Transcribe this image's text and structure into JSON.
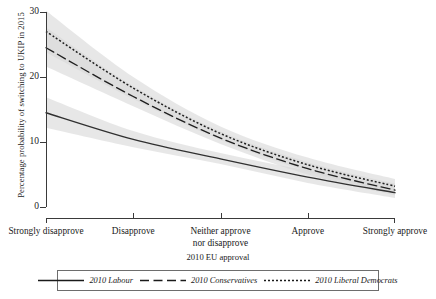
{
  "chart_data": {
    "type": "line",
    "title": "",
    "xlabel": "2010 EU approval",
    "ylabel": "Percentage probability of switching to UKIP in 2015",
    "categories": [
      "Strongly disapprove",
      "Disapprove",
      "Neither approve nor disapprove",
      "Approve",
      "Strongly approve"
    ],
    "category_lines": [
      [
        "Strongly disapprove"
      ],
      [
        "Disapprove"
      ],
      [
        "Neither approve",
        "nor disapprove"
      ],
      [
        "Approve"
      ],
      [
        "Strongly approve"
      ]
    ],
    "x": [
      1,
      2,
      3,
      4,
      5
    ],
    "ylim": [
      0,
      30
    ],
    "yticks": [
      0,
      10,
      20,
      30
    ],
    "ytick_labels": [
      "0",
      "10",
      "20",
      "30"
    ],
    "grid": false,
    "legend_position": "bottom",
    "series": [
      {
        "name": "2010 Labour",
        "style": "solid",
        "color": "#303030",
        "values": [
          14.5,
          10.4,
          7.4,
          4.6,
          2.2
        ],
        "ci_low": [
          12.2,
          9.2,
          6.6,
          3.7,
          1.4
        ],
        "ci_high": [
          16.9,
          11.7,
          8.3,
          5.6,
          3.2
        ]
      },
      {
        "name": "2010 Conservatives",
        "style": "dashed",
        "color": "#202020",
        "values": [
          24.5,
          17.0,
          10.6,
          5.9,
          2.6
        ],
        "ci_low": [
          21.6,
          15.5,
          9.7,
          5.0,
          1.8
        ],
        "ci_high": [
          27.6,
          18.6,
          11.6,
          6.9,
          3.6
        ]
      },
      {
        "name": "2010 Liberal Democrats",
        "style": "dotted",
        "color": "#202020",
        "values": [
          27.0,
          18.3,
          11.3,
          6.5,
          3.2
        ],
        "ci_low": [
          23.8,
          16.6,
          10.3,
          5.5,
          2.2
        ],
        "ci_high": [
          30.2,
          20.0,
          12.4,
          7.6,
          4.3
        ]
      }
    ],
    "band_color": "#d9d9d9"
  },
  "legend": {
    "entries": [
      {
        "label": "2010 Labour",
        "style": "solid"
      },
      {
        "label": "2010 Conservatives",
        "style": "dashed"
      },
      {
        "label": "2010 Liberal Democrats",
        "style": "dotted"
      }
    ]
  }
}
